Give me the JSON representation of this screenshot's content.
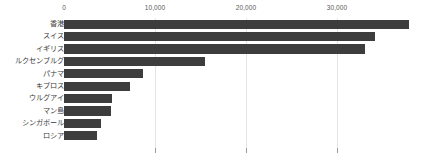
{
  "chart_data": {
    "type": "bar",
    "orientation": "horizontal",
    "title": "",
    "subtitle": "",
    "xlabel": "",
    "ylabel": "",
    "categories": [
      "香港",
      "スイス",
      "イギリス",
      "ルクセンブルグ",
      "パナマ",
      "キプロス",
      "ウルグアイ",
      "マン島",
      "シンガポール",
      "ロシア"
    ],
    "values": [
      37900,
      34200,
      33100,
      15500,
      8700,
      7300,
      5300,
      5200,
      4100,
      3600
    ],
    "series": [
      {
        "name": "",
        "values": [
          37900,
          34200,
          33100,
          15500,
          8700,
          7300,
          5300,
          5200,
          4100,
          3600
        ]
      }
    ],
    "xlim": [
      0,
      38000
    ],
    "xticks": [
      0,
      10000,
      20000,
      30000
    ],
    "xtick_labels": [
      "0",
      "10,000",
      "20,000",
      "30,000"
    ],
    "grid": "vertical-only",
    "legend": "none",
    "bar_color": "#3d3d3d",
    "gridline_color": "#e4e4e4",
    "tick_color": "#9a9a9a",
    "axis_label_color": "#5a5a5a",
    "category_label_color": "#3b3b3b",
    "background_color": "#ffffff"
  },
  "axis": {
    "ticks": [
      {
        "label": "0",
        "value": 0
      },
      {
        "label": "10,000",
        "value": 10000
      },
      {
        "label": "20,000",
        "value": 20000
      },
      {
        "label": "30,000",
        "value": 30000
      }
    ]
  },
  "rows": [
    {
      "label": "香港",
      "value": 37900
    },
    {
      "label": "スイス",
      "value": 34200
    },
    {
      "label": "イギリス",
      "value": 33100
    },
    {
      "label": "ルクセンブルグ",
      "value": 15500
    },
    {
      "label": "パナマ",
      "value": 8700
    },
    {
      "label": "キプロス",
      "value": 7300
    },
    {
      "label": "ウルグアイ",
      "value": 5300
    },
    {
      "label": "マン島",
      "value": 5200
    },
    {
      "label": "シンガポール",
      "value": 4100
    },
    {
      "label": "ロシア",
      "value": 3600
    }
  ]
}
